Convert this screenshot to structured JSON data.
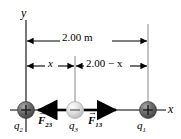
{
  "figure": {
    "type": "physics-free-body-diagram",
    "background_color": "#ffffff",
    "line_color": "#000000",
    "guide_color": "#808080"
  },
  "axes": {
    "y_label": "y",
    "x_label": "x"
  },
  "dimensions": {
    "total": {
      "label": "2.00 m",
      "from_charge": "q2",
      "to_charge": "q1"
    },
    "left_segment": {
      "label": "x"
    },
    "right_segment": {
      "label": "2.00 − x"
    }
  },
  "charges": [
    {
      "name": "q2",
      "label": "q",
      "subscript": "2",
      "sign": "+",
      "color": "#595959",
      "highlight": "#9a9a9a"
    },
    {
      "name": "q3",
      "label": "q",
      "subscript": "3",
      "sign": "−",
      "color": "#d8d8d8",
      "highlight": "#f2f2f2"
    },
    {
      "name": "q1",
      "label": "q",
      "subscript": "1",
      "sign": "+",
      "color": "#595959",
      "highlight": "#9a9a9a"
    }
  ],
  "forces": [
    {
      "name": "F23",
      "symbol": "F",
      "subscript": "23",
      "direction": "left",
      "vector_arrow": "→"
    },
    {
      "name": "F13",
      "symbol": "F",
      "subscript": "13",
      "direction": "right",
      "vector_arrow": "→"
    }
  ]
}
